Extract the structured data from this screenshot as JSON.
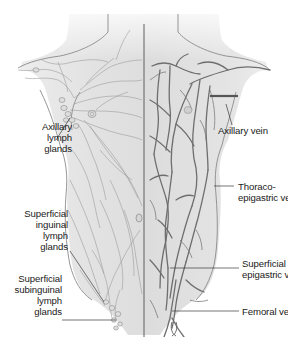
{
  "figure": {
    "colors": {
      "skin_fill": "#e4e4e4",
      "skin_fill_light": "#f0f0f0",
      "outline": "#8a8a8a",
      "lymph_vessel": "#9a9a9a",
      "vein": "#6e6e6e",
      "midline": "#5e5e5e",
      "label_text": "#1a1a1a",
      "leader_line": "#3a3a3a"
    }
  },
  "labels_left": [
    {
      "id": "axillary-lymph-glands",
      "lines": [
        "Axillary",
        "lymph",
        "glands"
      ]
    },
    {
      "id": "superficial-inguinal-lymph-glands",
      "lines": [
        "Superficial",
        "inguinal",
        "lymph",
        "glands"
      ]
    },
    {
      "id": "superficial-subinguinal-lymph-glands",
      "lines": [
        "Superficial",
        "subinguinal",
        "lymph",
        "glands"
      ]
    }
  ],
  "labels_right": [
    {
      "id": "axillary-vein",
      "lines": [
        "Axillary vein"
      ]
    },
    {
      "id": "thoraco-epigastric-vein",
      "lines": [
        "Thoraco-",
        "epigastric vein"
      ]
    },
    {
      "id": "superficial-epigastric-vein",
      "lines": [
        "Superficial",
        "epigastric vein"
      ]
    },
    {
      "id": "femoral-vein",
      "lines": [
        "Femoral vein"
      ]
    }
  ]
}
